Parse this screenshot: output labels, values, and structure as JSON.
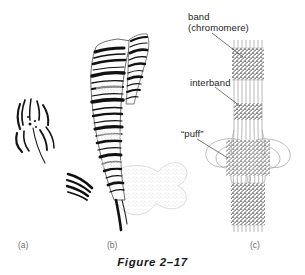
{
  "figure": {
    "caption": "Figure 2–17",
    "background_color": "#ffffff",
    "ink_color": "#1a1a1a"
  },
  "labels": {
    "band": "band\n(chromomere)",
    "interband": "interband",
    "puff": "“puff”"
  },
  "panels": [
    {
      "letter": "(a)",
      "name": "polytene-chromosome-cluster",
      "description": "small cluster of curved chromosome arms radiating from a central chromocenter"
    },
    {
      "letter": "(b)",
      "name": "banded-polytene-chromosome",
      "description": "light-micrograph style drawing of a banded polytene chromosome with dark transverse bands and a stippled chromocenter"
    },
    {
      "letter": "(c)",
      "name": "chromosome-fiber-diagram",
      "description": "schematic of parallel chromatin fibers showing granular bands, clear interbands and an expanded puff of looped fibers"
    }
  ]
}
